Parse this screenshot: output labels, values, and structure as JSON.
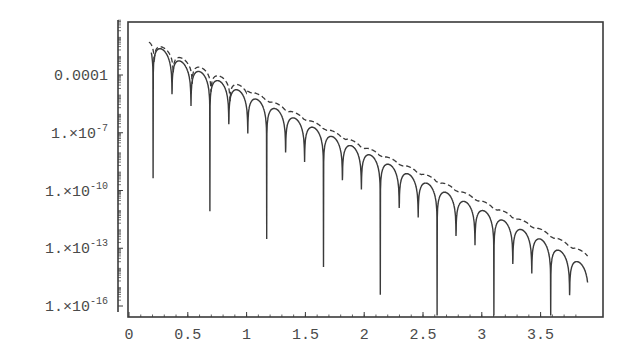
{
  "chart_data": {
    "type": "line",
    "title": "",
    "xlabel": "",
    "ylabel": "",
    "xscale": "linear",
    "yscale": "log",
    "xlim": [
      0,
      3.9
    ],
    "ylim": [
      1e-16,
      0.01
    ],
    "grid": false,
    "legend": null,
    "x_ticks": [
      {
        "value": 0,
        "label": "0"
      },
      {
        "value": 0.5,
        "label": "0.5"
      },
      {
        "value": 1,
        "label": "1"
      },
      {
        "value": 1.5,
        "label": "1.5"
      },
      {
        "value": 2,
        "label": "2"
      },
      {
        "value": 2.5,
        "label": "2.5"
      },
      {
        "value": 3,
        "label": "3"
      },
      {
        "value": 3.5,
        "label": "3.5"
      }
    ],
    "y_ticks": [
      {
        "value": 0.0001,
        "label": "0.0001",
        "mant": "0.0001",
        "exp": ""
      },
      {
        "value": 1e-07,
        "label": "1.×10^-7",
        "mant": "1.×10",
        "exp": "-7"
      },
      {
        "value": 1e-10,
        "label": "1.×10^-10",
        "mant": "1.×10",
        "exp": "-10"
      },
      {
        "value": 1e-13,
        "label": "1.×10^-13",
        "mant": "1.×10",
        "exp": "-13"
      },
      {
        "value": 1e-16,
        "label": "1.×10^-16",
        "mant": "1.×10",
        "exp": "-16"
      }
    ],
    "series": [
      {
        "name": "oscillating solution",
        "style": "solid",
        "color": "#3a3a3a",
        "description": "Scalloped oscillation with sharp zeros; envelope decays log-linearly",
        "x_start": 0.19,
        "x_end": 3.9,
        "zero_spacing": 0.161,
        "envelope": {
          "x": [
            0.19,
            0.5,
            1.0,
            1.5,
            2.0,
            2.5,
            3.0,
            3.5,
            3.9
          ],
          "y": [
            0.005,
            0.0003,
            1e-05,
            3e-07,
            1e-08,
            3e-10,
            1e-11,
            3e-13,
            1e-14
          ]
        },
        "dip_floor_approx": 1e-16
      },
      {
        "name": "dashed bound",
        "style": "dashed",
        "color": "#3a3a3a",
        "description": "Dashed curve tracking just above the oscillation peaks",
        "x_start": 0.17,
        "x_end": 3.9,
        "envelope": {
          "x": [
            0.19,
            0.5,
            1.0,
            1.5,
            2.0,
            2.5,
            3.0,
            3.5,
            3.9
          ],
          "y": [
            0.006,
            0.0005,
            2e-05,
            6e-07,
            2e-08,
            8e-10,
            3e-11,
            1e-12,
            5e-14
          ]
        }
      }
    ]
  },
  "colors": {
    "ink": "#3a3a3a",
    "label": "#4a4a4a",
    "background": "#ffffff"
  }
}
